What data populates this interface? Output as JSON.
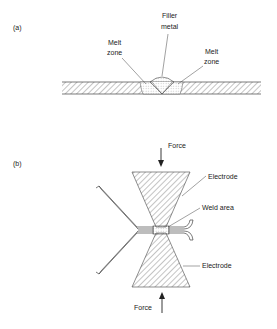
{
  "panel_a": {
    "label": "(a)",
    "filler_line1": "Filler",
    "filler_line2": "metal",
    "melt_left_line1": "Melt",
    "melt_left_line2": "zone",
    "melt_right_line1": "Melt",
    "melt_right_line2": "zone"
  },
  "panel_b": {
    "label": "(b)",
    "force_top": "Force",
    "force_bottom": "Force",
    "electrode_top": "Electrode",
    "weld_area": "Weld area",
    "electrode_bottom": "Electrode"
  }
}
